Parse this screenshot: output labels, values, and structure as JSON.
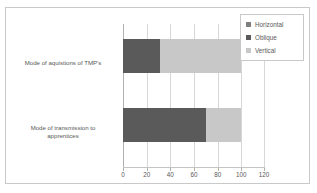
{
  "chart_data": {
    "type": "bar",
    "orientation": "horizontal",
    "stacked": true,
    "title": "",
    "xlabel": "",
    "ylabel": "",
    "xlim": [
      0,
      120
    ],
    "xticks": [
      0,
      20,
      40,
      60,
      80,
      100,
      120
    ],
    "grid": true,
    "legend_position": "top-right",
    "categories": [
      "Mode of aquistions of TMP's",
      "Mode of transmission to apprentices"
    ],
    "series": [
      {
        "name": "Horizontal",
        "color": "#7f7f7f",
        "values": [
          0,
          0
        ]
      },
      {
        "name": "Oblique",
        "color": "#5a5a5a",
        "values": [
          31,
          70
        ]
      },
      {
        "name": "Vertical",
        "color": "#c8c8c8",
        "values": [
          69,
          30
        ]
      }
    ]
  },
  "legend": {
    "items": [
      {
        "label": "Horizontal"
      },
      {
        "label": "Oblique"
      },
      {
        "label": "Vertical"
      }
    ]
  },
  "axis": {
    "tick_labels": [
      "0",
      "20",
      "40",
      "60",
      "80",
      "100",
      "120"
    ]
  },
  "category_labels": [
    {
      "line1": "Mode of aquistions of TMP's",
      "line2": ""
    },
    {
      "line1": "Mode of transmission to",
      "line2": "apprentices"
    }
  ],
  "colors": {
    "horizontal": "#7f7f7f",
    "oblique": "#5a5a5a",
    "vertical": "#c8c8c8",
    "gridline": "#d7d7d7",
    "border": "#c9c9c9",
    "text": "#595959"
  }
}
